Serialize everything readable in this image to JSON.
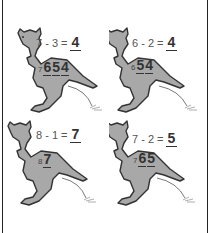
{
  "worksheet": {
    "problems": [
      {
        "equation": "7 - 3 =",
        "answer": "4",
        "start": "7",
        "hops": [
          "6",
          "5",
          "4"
        ]
      },
      {
        "equation": "6 - 2 =",
        "answer": "4",
        "start": "6",
        "hops": [
          "5",
          "4"
        ]
      },
      {
        "equation": "8 - 1 =",
        "answer": "7",
        "start": "8",
        "hops": [
          "7"
        ]
      },
      {
        "equation": "7 - 2 =",
        "answer": "5",
        "start": "7",
        "hops": [
          "6",
          "5"
        ]
      }
    ]
  },
  "colors": {
    "kangaroo_fill": "#a8a8a8",
    "outline": "#333333",
    "border": "#222222"
  }
}
